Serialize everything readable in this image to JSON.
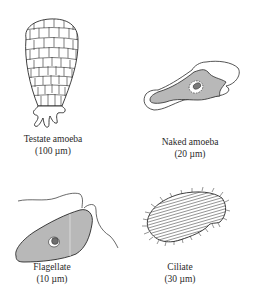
{
  "figure": {
    "colors": {
      "ink": "#2a2a2a",
      "cell_fill": "#b8b8b8",
      "background": "#ffffff"
    },
    "organisms": [
      {
        "name": "Testate amoeba",
        "size": "(100 µm)",
        "icon": "testate-amoeba-icon"
      },
      {
        "name": "Naked amoeba",
        "size": "(20 µm)",
        "icon": "naked-amoeba-icon"
      },
      {
        "name": "Flagellate",
        "size": "(10 µm)",
        "icon": "flagellate-icon"
      },
      {
        "name": "Ciliate",
        "size": "(30 µm)",
        "icon": "ciliate-icon"
      }
    ]
  }
}
